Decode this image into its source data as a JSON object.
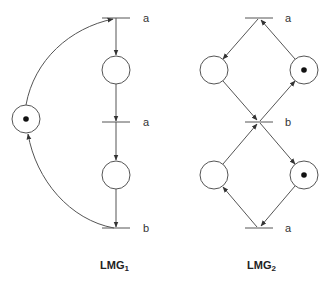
{
  "colors": {
    "stroke": "#555555",
    "token": "#111111",
    "text": "#333333"
  },
  "nets": [
    {
      "title": "LMG",
      "subscript": "1",
      "transitions": [
        {
          "label": "a"
        },
        {
          "label": "a"
        },
        {
          "label": "b"
        }
      ],
      "places": [
        {
          "tokens": 1
        },
        {
          "tokens": 0
        },
        {
          "tokens": 0
        }
      ]
    },
    {
      "title": "LMG",
      "subscript": "2",
      "transitions": [
        {
          "label": "a"
        },
        {
          "label": "b"
        },
        {
          "label": "a"
        }
      ],
      "places": [
        {
          "tokens": 0
        },
        {
          "tokens": 1
        },
        {
          "tokens": 0
        },
        {
          "tokens": 1
        }
      ]
    }
  ]
}
